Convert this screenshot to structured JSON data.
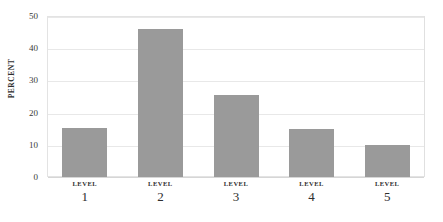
{
  "chart_data": {
    "type": "bar",
    "title": "",
    "xlabel": "",
    "ylabel": "PERCENT",
    "categories": [
      "LEVEL 1",
      "LEVEL 2",
      "LEVEL 3",
      "LEVEL 4",
      "LEVEL 5"
    ],
    "category_names": [
      "LEVEL",
      "LEVEL",
      "LEVEL",
      "LEVEL",
      "LEVEL"
    ],
    "category_values": [
      "1",
      "2",
      "3",
      "4",
      "5"
    ],
    "values": [
      15.3,
      46,
      25.4,
      15,
      10
    ],
    "ylim": [
      0,
      50
    ],
    "yticks": [
      0,
      10,
      20,
      30,
      40,
      50
    ],
    "ytick_labels": [
      "0",
      "10",
      "20",
      "30",
      "40",
      "50"
    ],
    "grid": true,
    "legend": false,
    "bar_color": "#9a9a9a",
    "gridline_color": "#e8e8e8",
    "frame_color": "#e3e3e3",
    "background_color": "#ffffff"
  }
}
